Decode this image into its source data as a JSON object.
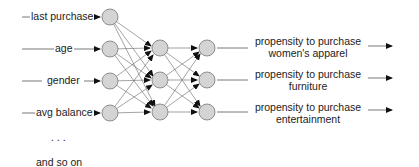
{
  "diagram": {
    "type": "neural network",
    "inputs": [
      {
        "label": "last purchase"
      },
      {
        "label": "age"
      },
      {
        "label": "gender"
      },
      {
        "label": "avg balance"
      }
    ],
    "ellipsis": ". . .",
    "more_label": "and so on",
    "hidden_layers": 2,
    "nodes_per_hidden_layer": 3,
    "outputs": [
      {
        "line1": "propensity to purchase",
        "line2": "women's apparel"
      },
      {
        "line1": "propensity to purchase",
        "line2": "furniture"
      },
      {
        "line1": "propensity to purchase",
        "line2": "entertainment"
      }
    ],
    "colors": {
      "node_fill": "#d4d4d4",
      "node_stroke": "#777777",
      "line": "#555555",
      "arrow": "#111111"
    }
  }
}
